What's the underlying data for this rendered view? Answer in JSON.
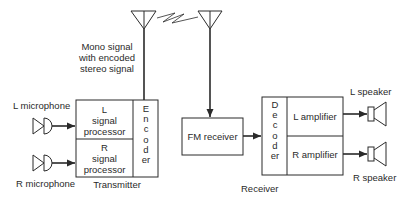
{
  "diagram": {
    "transmission_note": "Mono signal\nwith encoded\nstereo signal",
    "transmitter": {
      "label": "Transmitter",
      "inputs": [
        {
          "label": "L microphone"
        },
        {
          "label": "R microphone"
        }
      ],
      "blocks": [
        {
          "label": "L\nsignal\nprocessor"
        },
        {
          "label": "R\nsignal\nprocessor"
        }
      ],
      "encoder": "Encoder"
    },
    "receiver": {
      "label": "Receiver",
      "fm_receiver": "FM receiver",
      "decoder": "Decoder",
      "blocks": [
        {
          "label": "L amplifier"
        },
        {
          "label": "R amplifier"
        }
      ],
      "outputs": [
        {
          "label": "L speaker"
        },
        {
          "label": "R speaker"
        }
      ]
    },
    "colors": {
      "line": "#2a2a2a",
      "background": "#ffffff"
    }
  }
}
